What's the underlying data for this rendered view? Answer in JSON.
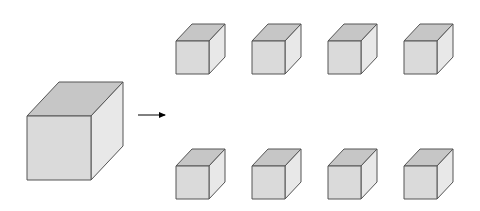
{
  "diagram": {
    "arrow": {
      "x1": 138,
      "y1": 115,
      "x2": 165,
      "y2": 115,
      "color": "#000000"
    },
    "colors": {
      "top_face": "#c6c6c6",
      "front_face": "#dadada",
      "side_face": "#e8e8e8",
      "edge": "#555555",
      "background": "#ffffff"
    },
    "large_cube": {
      "x": 27,
      "y": 116,
      "size": 64,
      "dx": 32,
      "dy": -34
    },
    "small_cubes": [
      {
        "row": 1,
        "col": 1,
        "x": 176,
        "y": 41,
        "size": 33,
        "dx": 16,
        "dy": -17
      },
      {
        "row": 1,
        "col": 2,
        "x": 252,
        "y": 41,
        "size": 33,
        "dx": 16,
        "dy": -17
      },
      {
        "row": 1,
        "col": 3,
        "x": 328,
        "y": 41,
        "size": 33,
        "dx": 16,
        "dy": -17
      },
      {
        "row": 1,
        "col": 4,
        "x": 404,
        "y": 41,
        "size": 33,
        "dx": 16,
        "dy": -17
      },
      {
        "row": 2,
        "col": 1,
        "x": 176,
        "y": 166,
        "size": 33,
        "dx": 16,
        "dy": -17
      },
      {
        "row": 2,
        "col": 2,
        "x": 252,
        "y": 166,
        "size": 33,
        "dx": 16,
        "dy": -17
      },
      {
        "row": 2,
        "col": 3,
        "x": 328,
        "y": 166,
        "size": 33,
        "dx": 16,
        "dy": -17
      },
      {
        "row": 2,
        "col": 4,
        "x": 404,
        "y": 166,
        "size": 33,
        "dx": 16,
        "dy": -17
      }
    ]
  }
}
